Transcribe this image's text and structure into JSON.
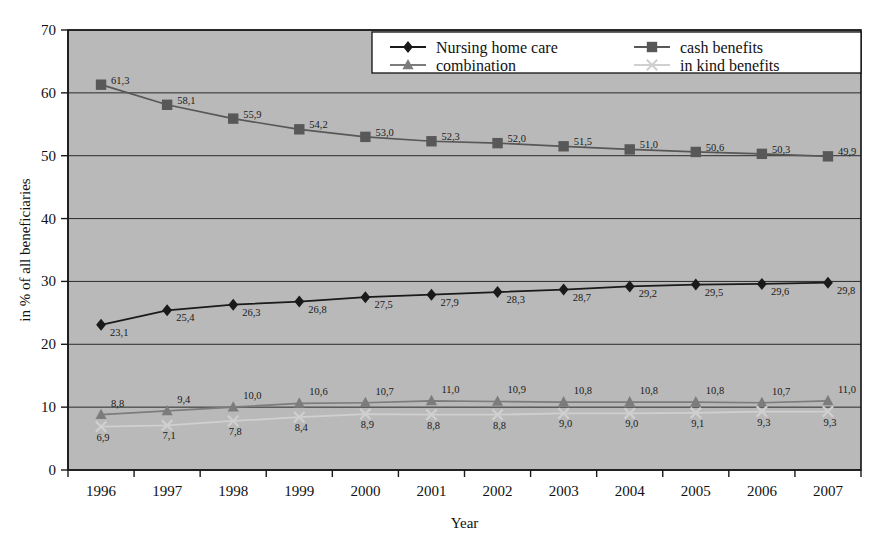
{
  "chart_data": {
    "type": "line",
    "title": "",
    "xlabel": "Year",
    "ylabel": "in % of all beneficiaries",
    "categories": [
      "1996",
      "1997",
      "1998",
      "1999",
      "2000",
      "2001",
      "2002",
      "2003",
      "2004",
      "2005",
      "2006",
      "2007"
    ],
    "ylim": [
      0,
      70
    ],
    "yticks": [
      0,
      10,
      20,
      30,
      40,
      50,
      60,
      70
    ],
    "grid": true,
    "legend_position": "top-center",
    "series": [
      {
        "name": "Nursing home care",
        "marker": "diamond",
        "color": "#1a1a1a",
        "values": [
          23.1,
          25.4,
          26.3,
          26.8,
          27.5,
          27.9,
          28.3,
          28.7,
          29.2,
          29.5,
          29.6,
          29.8
        ],
        "labels": [
          "23,1",
          "25,4",
          "26,3",
          "26,8",
          "27,5",
          "27,9",
          "28,3",
          "28,7",
          "29,2",
          "29,5",
          "29,6",
          "29,8"
        ]
      },
      {
        "name": "cash benefits",
        "marker": "square",
        "color": "#585858",
        "values": [
          61.3,
          58.1,
          55.9,
          54.2,
          53.0,
          52.3,
          52.0,
          51.5,
          51.0,
          50.6,
          50.3,
          49.9
        ],
        "labels": [
          "61,3",
          "58,1",
          "55,9",
          "54,2",
          "53,0",
          "52,3",
          "52,0",
          "51,5",
          "51,0",
          "50,6",
          "50,3",
          "49,9"
        ]
      },
      {
        "name": "combination",
        "marker": "triangle",
        "color": "#7c7c7c",
        "values": [
          8.8,
          9.4,
          10.0,
          10.6,
          10.7,
          11.0,
          10.9,
          10.8,
          10.8,
          10.8,
          10.7,
          11.0
        ],
        "labels": [
          "8,8",
          "9,4",
          "10,0",
          "10,6",
          "10,7",
          "11,0",
          "10,9",
          "10,8",
          "10,8",
          "10,8",
          "10,7",
          "11,0"
        ]
      },
      {
        "name": "in kind benefits",
        "marker": "cross",
        "color": "#d0d0d0",
        "values": [
          6.9,
          7.1,
          7.8,
          8.4,
          8.9,
          8.8,
          8.8,
          9.0,
          9.0,
          9.1,
          9.3,
          9.3
        ],
        "labels": [
          "6,9",
          "7,1",
          "7,8",
          "8,4",
          "8,9",
          "8,8",
          "8,8",
          "9,0",
          "9,0",
          "9,1",
          "9,3",
          "9,3"
        ]
      }
    ],
    "legend_entries": [
      {
        "label": "Nursing home care",
        "marker": "diamond",
        "color": "#1a1a1a"
      },
      {
        "label": "cash benefits",
        "marker": "square",
        "color": "#585858"
      },
      {
        "label": "combination",
        "marker": "triangle",
        "color": "#7c7c7c"
      },
      {
        "label": "in kind benefits",
        "marker": "cross",
        "color": "#d0d0d0"
      }
    ],
    "plot_background_color": "#b9b9b9",
    "page_background_color": "#ffffff"
  }
}
